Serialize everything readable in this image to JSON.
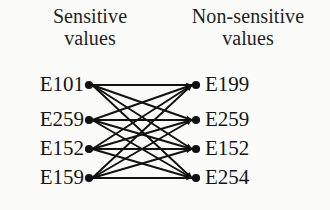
{
  "figure": {
    "type": "bipartite-mapping-diagram",
    "background_color": "#fbfbfa",
    "ink_color": "#121212"
  },
  "headers": {
    "left": {
      "line1": "Sensitive",
      "line2": "values"
    },
    "right": {
      "line1": "Non-sensitive",
      "line2": "values"
    }
  },
  "left_nodes": [
    {
      "label": "E101",
      "x": 89,
      "y": 85
    },
    {
      "label": "E259",
      "x": 89,
      "y": 120
    },
    {
      "label": "E152",
      "x": 89,
      "y": 149
    },
    {
      "label": "E159",
      "x": 89,
      "y": 178
    }
  ],
  "right_nodes": [
    {
      "label": "E199",
      "x": 196,
      "y": 85
    },
    {
      "label": "E259",
      "x": 196,
      "y": 120
    },
    {
      "label": "E152",
      "x": 196,
      "y": 149
    },
    {
      "label": "E254",
      "x": 196,
      "y": 178
    }
  ],
  "edges": [
    {
      "from": 0,
      "to": 0
    },
    {
      "from": 0,
      "to": 1
    },
    {
      "from": 0,
      "to": 2
    },
    {
      "from": 0,
      "to": 3
    },
    {
      "from": 1,
      "to": 0
    },
    {
      "from": 1,
      "to": 1
    },
    {
      "from": 1,
      "to": 2
    },
    {
      "from": 1,
      "to": 3
    },
    {
      "from": 2,
      "to": 0
    },
    {
      "from": 2,
      "to": 1
    },
    {
      "from": 2,
      "to": 2
    },
    {
      "from": 2,
      "to": 3
    },
    {
      "from": 3,
      "to": 0
    },
    {
      "from": 3,
      "to": 1
    },
    {
      "from": 3,
      "to": 2
    },
    {
      "from": 3,
      "to": 3
    }
  ]
}
